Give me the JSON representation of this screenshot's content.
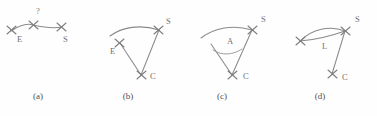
{
  "figure": {
    "background_color": "#fefefe",
    "stroke_color": "#8a8a8a",
    "label_color": "#6f6f6f",
    "caption_color": "#4f4f4f",
    "panel_count": 4
  },
  "panels": [
    {
      "id": "a",
      "caption": "(a)",
      "caption_x": 38,
      "description": "arc-with-three-cross-marks",
      "labels": [
        {
          "name": "label-e",
          "text": "E",
          "x": 17,
          "y": 42
        },
        {
          "name": "label-question",
          "text": "?",
          "x": 36,
          "y": 14
        },
        {
          "name": "label-s",
          "text": "S",
          "x": 63,
          "y": 42
        }
      ],
      "marks": [
        {
          "name": "cross-left-end",
          "x": 11,
          "y": 30
        },
        {
          "name": "cross-middle",
          "x": 33,
          "y": 25
        },
        {
          "name": "cross-right-start",
          "x": 61,
          "y": 27
        }
      ]
    },
    {
      "id": "b",
      "caption": "(b)",
      "caption_x": 128,
      "description": "arc-with-center-and-two-radii",
      "labels": [
        {
          "name": "label-s",
          "text": "S",
          "x": 166,
          "y": 24
        },
        {
          "name": "label-e",
          "text": "E",
          "x": 110,
          "y": 54
        },
        {
          "name": "label-c",
          "text": "C",
          "x": 150,
          "y": 79
        }
      ],
      "marks": [
        {
          "name": "cross-s",
          "x": 158,
          "y": 30
        },
        {
          "name": "cross-e",
          "x": 119,
          "y": 42
        },
        {
          "name": "cross-c",
          "x": 141,
          "y": 75
        }
      ]
    },
    {
      "id": "c",
      "caption": "(c)",
      "caption_x": 222,
      "description": "arc-with-center-angle-A",
      "labels": [
        {
          "name": "label-s",
          "text": "S",
          "x": 261,
          "y": 22
        },
        {
          "name": "label-a",
          "text": "A",
          "x": 227,
          "y": 44
        },
        {
          "name": "label-c",
          "text": "C",
          "x": 243,
          "y": 79
        }
      ],
      "marks": [
        {
          "name": "cross-s",
          "x": 252,
          "y": 30
        },
        {
          "name": "cross-c",
          "x": 232,
          "y": 75
        }
      ]
    },
    {
      "id": "d",
      "caption": "(d)",
      "caption_x": 320,
      "description": "lens-chord-length-L",
      "labels": [
        {
          "name": "label-s",
          "text": "S",
          "x": 355,
          "y": 22
        },
        {
          "name": "label-l",
          "text": "L",
          "x": 322,
          "y": 49
        },
        {
          "name": "label-c",
          "text": "C",
          "x": 342,
          "y": 80
        }
      ],
      "marks": [
        {
          "name": "cross-s",
          "x": 345,
          "y": 31
        },
        {
          "name": "cross-c",
          "x": 332,
          "y": 74
        }
      ]
    }
  ]
}
